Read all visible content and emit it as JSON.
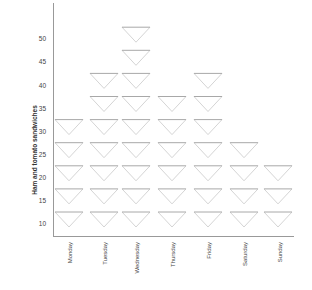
{
  "chart_data": {
    "type": "bar",
    "style": "pictogram (stacked inverted triangles, each triangle = 5 sandwiches)",
    "title": "",
    "xlabel": "",
    "ylabel": "Ham and tomato sandwiches",
    "categories": [
      "Monday",
      "Tuesday",
      "Wednesday",
      "Thursday",
      "Friday",
      "Saturday",
      "Sunday"
    ],
    "values": [
      30,
      40,
      50,
      35,
      40,
      25,
      20
    ],
    "triangle_counts": [
      5,
      7,
      9,
      6,
      7,
      4,
      3
    ],
    "yticks": [
      10,
      15,
      20,
      25,
      30,
      35,
      40,
      45,
      50
    ],
    "ylim": [
      10,
      50
    ],
    "grid": false,
    "legend": null
  },
  "labels": {
    "ylabel": "Ham and tomato sandwiches",
    "yticks": [
      "50",
      "45",
      "40",
      "35",
      "30",
      "25",
      "20",
      "15",
      "10"
    ],
    "days": [
      "Monday",
      "Tuesday",
      "Wednesday",
      "Thursday",
      "Friday",
      "Saturday",
      "Sunday"
    ]
  },
  "colors": {
    "triangle_top": "#a8a8a8",
    "triangle_side": "#cfcfcf",
    "axis": "#999999",
    "text": "#444444"
  }
}
